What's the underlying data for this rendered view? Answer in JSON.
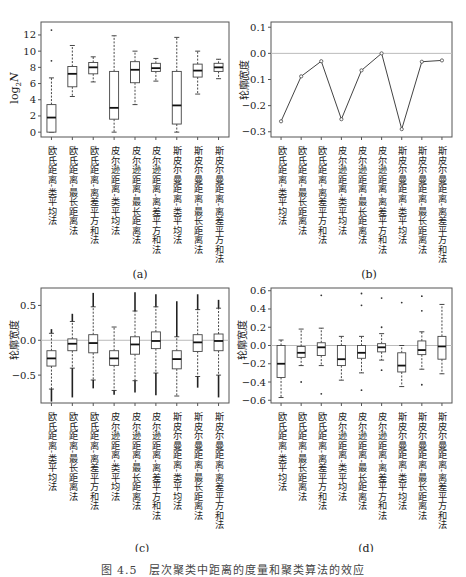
{
  "figure": {
    "caption": "图 4.5　层次聚类中距离的度量和聚类算法的效应"
  },
  "methods": [
    "欧氏距离-类平均法",
    "欧氏距离-最长距离法",
    "欧氏距离-离差平方和法",
    "皮尔逊距离-类平均法",
    "皮尔逊距离-最长距离法",
    "皮尔逊距离-离差平方和法",
    "斯皮尔曼距离-类平均法",
    "斯皮尔曼距离-最长距离法",
    "斯皮尔曼距离-离差平方和法"
  ],
  "chart_data": [
    {
      "panel": "(a)",
      "type": "box",
      "ylabel": "log2N",
      "ylim": [
        0,
        13
      ],
      "yticks": [
        0,
        2,
        4,
        6,
        8,
        10,
        12
      ],
      "reference_line": null,
      "boxes": [
        {
          "min": 0,
          "q1": 0,
          "median": 1.8,
          "q3": 3.4,
          "max": 6.7,
          "outliers": [
            8.8,
            12.6
          ]
        },
        {
          "min": 4.4,
          "q1": 5.6,
          "median": 7.2,
          "q3": 8.1,
          "max": 10.7,
          "outliers": []
        },
        {
          "min": 6.2,
          "q1": 7.2,
          "median": 8.0,
          "q3": 8.6,
          "max": 9.3,
          "outliers": []
        },
        {
          "min": 0,
          "q1": 1.6,
          "median": 3.0,
          "q3": 7.5,
          "max": 11.9,
          "outliers": []
        },
        {
          "min": 3.4,
          "q1": 6.1,
          "median": 7.7,
          "q3": 8.7,
          "max": 10.0,
          "outliers": []
        },
        {
          "min": 6.3,
          "q1": 7.5,
          "median": 7.9,
          "q3": 8.5,
          "max": 9.1,
          "outliers": []
        },
        {
          "min": 0,
          "q1": 1.0,
          "median": 3.3,
          "q3": 7.5,
          "max": 11.7,
          "outliers": []
        },
        {
          "min": 4.7,
          "q1": 6.8,
          "median": 7.6,
          "q3": 8.4,
          "max": 10.0,
          "outliers": []
        },
        {
          "min": 6.6,
          "q1": 7.5,
          "median": 8.0,
          "q3": 8.5,
          "max": 9.0,
          "outliers": []
        }
      ]
    },
    {
      "panel": "(b)",
      "type": "line",
      "ylabel": "轮廓宽度",
      "ylim": [
        -0.32,
        0.12
      ],
      "yticks": [
        0.1,
        0.0,
        -0.1,
        -0.2,
        -0.3
      ],
      "reference_line": 0.0,
      "values": [
        -0.26,
        -0.088,
        -0.03,
        -0.252,
        -0.065,
        0.0,
        -0.29,
        -0.032,
        -0.027
      ]
    },
    {
      "panel": "(c)",
      "type": "box",
      "ylabel": "轮廓宽度",
      "ylim": [
        -0.9,
        0.75
      ],
      "yticks": [
        0.5,
        0.0,
        -0.5
      ],
      "reference_line": 0.0,
      "boxes": [
        {
          "min": -0.7,
          "q1": -0.37,
          "median": -0.26,
          "q3": -0.15,
          "max": 0.1,
          "outliers_range": [
            -0.88,
            0.16
          ]
        },
        {
          "min": -0.4,
          "q1": -0.15,
          "median": -0.05,
          "q3": 0.02,
          "max": 0.27,
          "outliers_range": [
            -0.82,
            0.38
          ]
        },
        {
          "min": -0.57,
          "q1": -0.18,
          "median": -0.04,
          "q3": 0.08,
          "max": 0.48,
          "outliers_range": [
            -0.69,
            0.68
          ]
        },
        {
          "min": -0.72,
          "q1": -0.36,
          "median": -0.26,
          "q3": -0.15,
          "max": 0.19,
          "outliers_range": [
            -0.78,
            0.19
          ]
        },
        {
          "min": -0.58,
          "q1": -0.2,
          "median": -0.06,
          "q3": 0.05,
          "max": 0.42,
          "outliers_range": [
            -0.75,
            0.69
          ]
        },
        {
          "min": -0.47,
          "q1": -0.12,
          "median": -0.01,
          "q3": 0.12,
          "max": 0.48,
          "outliers_range": [
            -0.79,
            0.66
          ]
        },
        {
          "min": -0.8,
          "q1": -0.41,
          "median": -0.27,
          "q3": -0.15,
          "max": 0.05,
          "outliers_range": [
            -0.8,
            0.56
          ]
        },
        {
          "min": -0.52,
          "q1": -0.16,
          "median": -0.03,
          "q3": 0.08,
          "max": 0.44,
          "outliers_range": [
            -0.68,
            0.66
          ]
        },
        {
          "min": -0.5,
          "q1": -0.15,
          "median": -0.01,
          "q3": 0.09,
          "max": 0.46,
          "outliers_range": [
            -0.82,
            0.58
          ]
        }
      ]
    },
    {
      "panel": "(d)",
      "type": "box",
      "ylabel": "轮廓宽度",
      "ylim": [
        -0.63,
        0.63
      ],
      "yticks": [
        0.6,
        0.4,
        0.2,
        0.0,
        -0.2,
        -0.4,
        -0.6
      ],
      "reference_line": 0.0,
      "boxes": [
        {
          "min": -0.57,
          "q1": -0.35,
          "median": -0.2,
          "q3": 0.0,
          "max": 0.06,
          "outliers": []
        },
        {
          "min": -0.22,
          "q1": -0.13,
          "median": -0.08,
          "q3": -0.01,
          "max": 0.18,
          "outliers": [
            -0.4
          ]
        },
        {
          "min": -0.22,
          "q1": -0.11,
          "median": -0.02,
          "q3": 0.03,
          "max": 0.19,
          "outliers": [
            -0.53,
            0.55
          ]
        },
        {
          "min": -0.38,
          "q1": -0.22,
          "median": -0.15,
          "q3": 0.0,
          "max": 0.1,
          "outliers": []
        },
        {
          "min": -0.3,
          "q1": -0.14,
          "median": -0.08,
          "q3": 0.0,
          "max": 0.1,
          "outliers": [
            -0.49,
            0.44,
            0.57
          ]
        },
        {
          "min": -0.16,
          "q1": -0.07,
          "median": -0.02,
          "q3": 0.02,
          "max": 0.13,
          "outliers": [
            -0.27,
            0.2,
            0.52
          ]
        },
        {
          "min": -0.45,
          "q1": -0.29,
          "median": -0.22,
          "q3": -0.08,
          "max": 0.0,
          "outliers": [
            0.47
          ]
        },
        {
          "min": -0.26,
          "q1": -0.1,
          "median": -0.05,
          "q3": 0.05,
          "max": 0.15,
          "outliers": [
            -0.43,
            0.38,
            0.54
          ]
        },
        {
          "min": -0.31,
          "q1": -0.15,
          "median": -0.01,
          "q3": 0.1,
          "max": 0.45,
          "outliers": []
        }
      ]
    }
  ],
  "panels": {
    "a": {
      "label": "(a)",
      "ylabel_main": "log",
      "ylabel_sub": "2",
      "ylabel_tail": "N"
    },
    "b": {
      "label": "(b)",
      "ylabel": "轮廓宽度"
    },
    "c": {
      "label": "(c)",
      "ylabel": "轮廓宽度"
    },
    "d": {
      "label": "(d)",
      "ylabel": "轮廓宽度"
    }
  }
}
